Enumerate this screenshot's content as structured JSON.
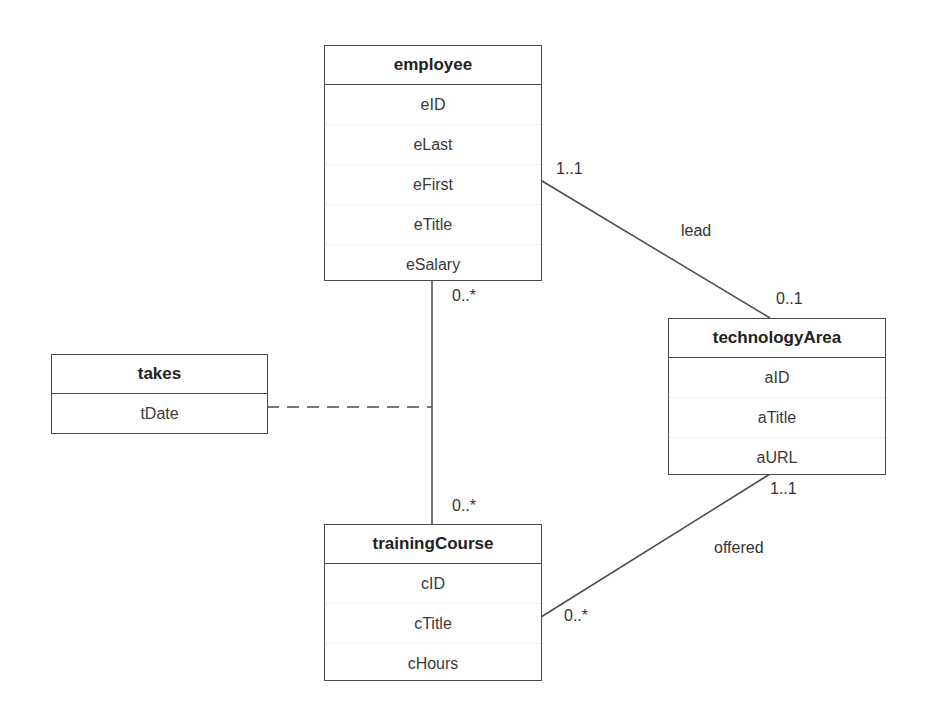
{
  "diagram": {
    "type": "UML class diagram",
    "classes": {
      "employee": {
        "name": "employee",
        "attributes": [
          "eID",
          "eLast",
          "eFirst",
          "eTitle",
          "eSalary"
        ]
      },
      "technologyArea": {
        "name": "technologyArea",
        "attributes": [
          "aID",
          "aTitle",
          "aURL"
        ]
      },
      "takes": {
        "name": "takes",
        "attributes": [
          "tDate"
        ]
      },
      "trainingCourse": {
        "name": "trainingCourse",
        "attributes": [
          "cID",
          "cTitle",
          "cHours"
        ]
      }
    },
    "associations": {
      "lead": {
        "name": "lead",
        "from": "employee",
        "to": "technologyArea",
        "from_multiplicity": "1..1",
        "to_multiplicity": "0..1"
      },
      "takes": {
        "name": "takes",
        "from": "employee",
        "to": "trainingCourse",
        "from_multiplicity": "0..*",
        "to_multiplicity": "0..*",
        "association_class": "takes"
      },
      "offered": {
        "name": "offered",
        "from": "technologyArea",
        "to": "trainingCourse",
        "from_multiplicity": "1..1",
        "to_multiplicity": "0..*"
      }
    },
    "colors": {
      "line": "#4a4a4a",
      "text": "#2a2a2a",
      "background": "#ffffff"
    }
  }
}
